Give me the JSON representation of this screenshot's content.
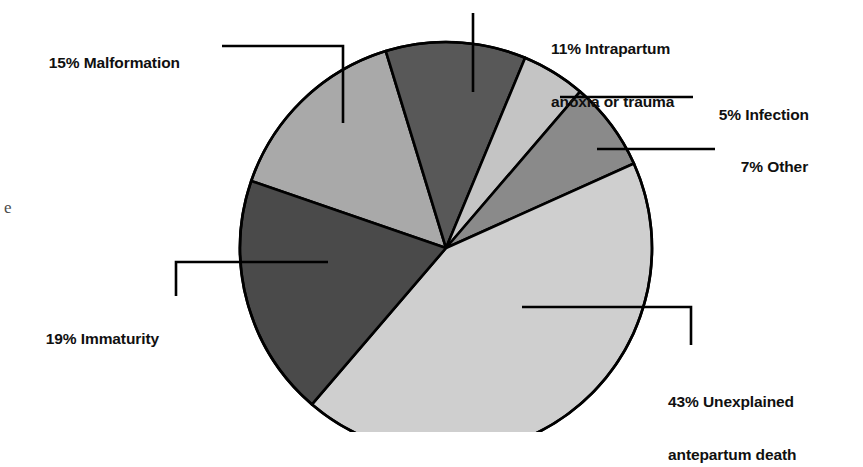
{
  "chart_data": {
    "type": "pie",
    "title": "",
    "subtitle": "",
    "xlabel": "",
    "ylabel": "",
    "legend_position": "callout-labels",
    "grid": false,
    "units": "percent",
    "total": 100,
    "categories": [
      "Malformation",
      "Intrapartum anoxia or trauma",
      "Infection",
      "Other",
      "Unexplained antepartum death",
      "Immaturity"
    ],
    "values": [
      15,
      11,
      5,
      7,
      43,
      19
    ],
    "slices": [
      {
        "id": "malformation",
        "label": "15% Malformation",
        "percent_text": "15%",
        "name": "Malformation",
        "value": 15,
        "color": "#a9a9a9",
        "start_angle": 289.0,
        "end_angle": 343.0
      },
      {
        "id": "intrapartum",
        "label": "11% Intrapartum anoxia or trauma",
        "label_line1": "11% Intrapartum",
        "label_line2": "anoxia or trauma",
        "percent_text": "11%",
        "name": "Intrapartum anoxia or trauma",
        "value": 11,
        "color": "#585858",
        "start_angle": 343.0,
        "end_angle": 382.6
      },
      {
        "id": "infection",
        "label": "5% Infection",
        "percent_text": "5%",
        "name": "Infection",
        "value": 5,
        "color": "#c4c4c4",
        "start_angle": 382.6,
        "end_angle": 400.6
      },
      {
        "id": "other",
        "label": "7% Other",
        "percent_text": "7%",
        "name": "Other",
        "value": 7,
        "color": "#8a8a8a",
        "start_angle": 400.6,
        "end_angle": 425.8
      },
      {
        "id": "unexplained",
        "label": "43% Unexplained antepartum death",
        "label_line1": "43% Unexplained",
        "label_line2": "antepartum death",
        "percent_text": "43%",
        "name": "Unexplained antepartum death",
        "value": 43,
        "color": "#cfcfcf",
        "start_angle": 425.8,
        "end_angle": 580.6
      },
      {
        "id": "immaturity",
        "label": "19% Immaturity",
        "percent_text": "19%",
        "name": "Immaturity",
        "value": 19,
        "color": "#4a4a4a",
        "start_angle": 580.6,
        "end_angle": 649.0
      }
    ]
  },
  "geometry": {
    "center_x": 446,
    "center_y": 248,
    "radius": 206,
    "stroke": "#000000",
    "stroke_width": 2.6,
    "background": "#ffffff"
  },
  "labels": {
    "malformation": {
      "text": "15% Malformation"
    },
    "intrapartum": {
      "line1": "11% Intrapartum",
      "line2": "anoxia or trauma"
    },
    "infection": {
      "text": "5% Infection"
    },
    "other": {
      "text": "7% Other"
    },
    "unexplained": {
      "line1": "43% Unexplained",
      "line2": "antepartum death"
    },
    "immaturity": {
      "text": "19% Immaturity"
    }
  },
  "artifacts": {
    "left_margin_glyph": "e"
  }
}
